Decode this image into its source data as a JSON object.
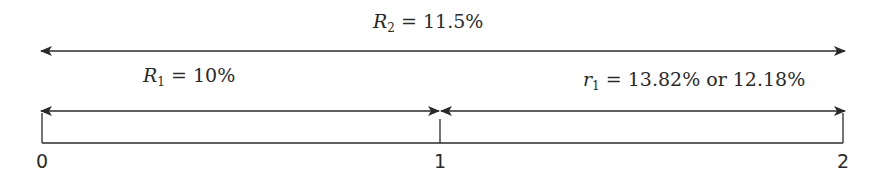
{
  "diagram": {
    "colors": {
      "line": "#2a2a2a",
      "background": "#ffffff"
    },
    "labels": {
      "R2": {
        "var": "R",
        "sub": "2",
        "rest": " = 11.5%"
      },
      "R1": {
        "var": "R",
        "sub": "1",
        "rest": " = 10%"
      },
      "r1": {
        "var": "r",
        "sub": "1",
        "rest": " = 13.82% or 12.18%"
      }
    },
    "ticks": [
      {
        "label": "0",
        "x": 42
      },
      {
        "label": "1",
        "x": 440
      },
      {
        "label": "2",
        "x": 843
      }
    ]
  }
}
